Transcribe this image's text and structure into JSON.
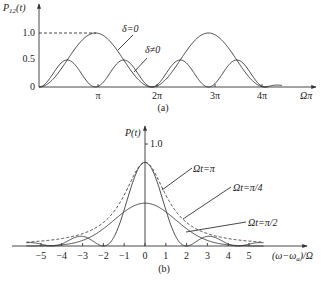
{
  "figure": {
    "panel_a": {
      "caption": "(a)",
      "ylabel": "P12(t)",
      "ylabel_main": "P",
      "ylabel_sub": "12",
      "ylabel_arg": "(t)",
      "xlabel": "Ωπ",
      "yticks": [
        {
          "label": "1.0",
          "value": 1.0
        },
        {
          "label": "0.5",
          "value": 0.5
        },
        {
          "label": "0",
          "value": 0
        }
      ],
      "xticks": [
        {
          "label": "π",
          "value": 1
        },
        {
          "label": "2π",
          "value": 2
        },
        {
          "label": "3π",
          "value": 3
        },
        {
          "label": "4π",
          "value": 4
        }
      ],
      "annotations": [
        {
          "label": "δ=0"
        },
        {
          "label": "δ≠0"
        }
      ]
    },
    "panel_b": {
      "caption": "(b)",
      "ylabel": "P(t)",
      "xlabel": "(ω−ωa)/Ω",
      "xlabel_pre": "(ω−ω",
      "xlabel_sub": "a",
      "xlabel_post": ")/Ω",
      "ytick": "1.0",
      "xticks": [
        "−5",
        "−4",
        "−3",
        "−2",
        "−1",
        "0",
        "1",
        "2",
        "3",
        "4",
        "5"
      ],
      "annotations": [
        {
          "label": "Ωt=π"
        },
        {
          "label": "Ωt=π/4"
        },
        {
          "label": "Ωt=π/2"
        }
      ]
    }
  },
  "chart_data": [
    {
      "type": "line",
      "title": "(a)",
      "xlabel": "Ωπ",
      "ylabel": "P12(t)",
      "xlim": [
        0,
        4.3
      ],
      "ylim": [
        0,
        1.0
      ],
      "x_unit": "π",
      "series": [
        {
          "name": "δ=0",
          "formula": "sin^2(πx/2)",
          "peaks": [
            [
              1,
              1.0
            ],
            [
              3,
              1.0
            ]
          ],
          "zeros": [
            0,
            2,
            4
          ]
        },
        {
          "name": "δ≠0",
          "formula": "0.5·sin^2(πx)",
          "peaks": [
            [
              0.5,
              0.5
            ],
            [
              1.5,
              0.5
            ],
            [
              2.5,
              0.5
            ],
            [
              3.5,
              0.5
            ]
          ],
          "zeros": [
            0,
            1,
            2,
            3,
            4
          ]
        }
      ],
      "reference_line": {
        "y": 1.0,
        "style": "dashed",
        "x_range": [
          0,
          1
        ]
      }
    },
    {
      "type": "line",
      "title": "(b)",
      "xlabel": "(ω−ωa)/Ω",
      "ylabel": "P(t)",
      "xlim": [
        -5.8,
        5.8
      ],
      "ylim": [
        0,
        1.0
      ],
      "series": [
        {
          "name": "Ωt=π",
          "style": "solid",
          "peak": [
            0,
            0.82
          ],
          "zeros": [
            -2,
            2
          ],
          "side_lobes": [
            [
              -3.3,
              0.09
            ],
            [
              3.3,
              0.09
            ]
          ]
        },
        {
          "name": "Ωt=π/4",
          "style": "dashed",
          "peak": [
            0,
            0.82
          ],
          "shape": "lorentzian-like, broad tails"
        },
        {
          "name": "Ωt=π/2",
          "style": "solid",
          "peak": [
            0,
            0.42
          ],
          "shape": "broad, smooth decay"
        }
      ]
    }
  ]
}
